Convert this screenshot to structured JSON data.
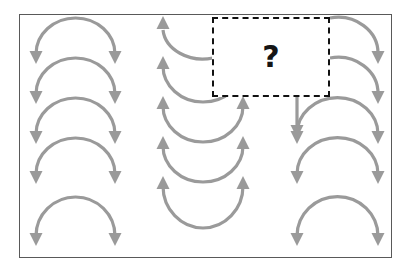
{
  "figure": {
    "background_color": "#ffffff",
    "frame": {
      "border_color": "#595959",
      "x": 19,
      "y": 14,
      "width": 373,
      "height": 244
    },
    "arrow_color": "#9a9a9a",
    "arrow_stroke_width": 3.2,
    "missing_tile": {
      "label": "?",
      "label_color": "#151515",
      "border_color": "#111111",
      "border_style": "dashed",
      "x": 212,
      "y": 17,
      "width": 118,
      "height": 80
    },
    "columns": [
      {
        "name": "left-column",
        "direction": "down",
        "shape": "arc-cap-down",
        "arrow_count": 5,
        "x_start": 36,
        "x_end": 115,
        "arrow_tip_y": [
          58,
          98,
          138,
          178,
          240
        ],
        "arc_top_y": [
          20,
          60,
          100,
          140,
          196
        ]
      },
      {
        "name": "middle-column",
        "direction": "up",
        "shape": "arc-cup-up",
        "arrow_count": 5,
        "x_start": 163,
        "x_end": 243,
        "arrow_tip_y": [
          20,
          60,
          100,
          140,
          180
        ],
        "arc_bottom_y": [
          58,
          98,
          138,
          178,
          244
        ]
      },
      {
        "name": "right-column",
        "direction": "down",
        "shape": "arc-cap-down",
        "arrow_count": 5,
        "x_start": 297,
        "x_end": 378,
        "arrow_tip_y": [
          58,
          98,
          138,
          178,
          240
        ],
        "arc_top_y": [
          20,
          60,
          100,
          140,
          196
        ]
      }
    ],
    "counts": {
      "total_arrows_visible": 15,
      "down_arcs": 10,
      "up_arcs": 5
    }
  }
}
